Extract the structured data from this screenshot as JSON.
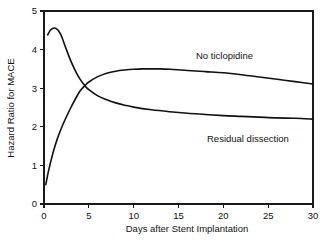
{
  "chart_data": {
    "type": "line",
    "title": "",
    "xlabel": "Days after Stent Implantation",
    "ylabel": "Hazard Ratio for MACE",
    "xlim": [
      0,
      30
    ],
    "ylim": [
      0,
      5
    ],
    "xticks": [
      0,
      5,
      10,
      15,
      20,
      25,
      30
    ],
    "xtick_labels": [
      "0",
      "5",
      "10",
      "15",
      "20",
      "25",
      "30"
    ],
    "yticks": [
      0,
      1,
      2,
      3,
      4,
      5
    ],
    "ytick_labels": [
      "0",
      "1",
      "2",
      "3",
      "4",
      "5"
    ],
    "grid": false,
    "legend_position": "inline-annotations",
    "frame": "box",
    "series": [
      {
        "name": "No ticlopidine",
        "color": "#111111",
        "label_position": {
          "x": 16.6,
          "y": 4.05
        },
        "x": [
          0.2,
          0.5,
          1.0,
          1.5,
          2.0,
          2.5,
          3.0,
          3.5,
          4.0,
          4.5,
          5.0,
          6.0,
          7.0,
          8.0,
          9.0,
          10.0,
          11.0,
          12.0,
          13.0,
          14.0,
          16.0,
          18.0,
          20.0,
          22.0,
          24.0,
          26.0,
          28.0,
          30.0
        ],
        "y": [
          0.5,
          0.85,
          1.32,
          1.7,
          2.0,
          2.26,
          2.5,
          2.72,
          2.92,
          3.05,
          3.16,
          3.3,
          3.39,
          3.44,
          3.47,
          3.49,
          3.5,
          3.5,
          3.5,
          3.49,
          3.46,
          3.43,
          3.4,
          3.35,
          3.29,
          3.23,
          3.17,
          3.11
        ]
      },
      {
        "name": "Residual dissection",
        "color": "#111111",
        "label_position": {
          "x": 18.0,
          "y": 2.55
        },
        "x": [
          0.4,
          0.7,
          1.0,
          1.2,
          1.5,
          1.8,
          2.0,
          2.5,
          3.0,
          3.5,
          4.0,
          4.5,
          5.0,
          6.0,
          7.0,
          8.0,
          9.0,
          10.0,
          12.0,
          14.0,
          16.0,
          18.0,
          20.0,
          22.0,
          24.0,
          26.0,
          28.0,
          30.0
        ],
        "y": [
          4.38,
          4.5,
          4.55,
          4.56,
          4.52,
          4.42,
          4.32,
          4.0,
          3.7,
          3.45,
          3.24,
          3.08,
          2.96,
          2.8,
          2.7,
          2.62,
          2.56,
          2.51,
          2.44,
          2.39,
          2.35,
          2.32,
          2.29,
          2.27,
          2.25,
          2.23,
          2.22,
          2.2
        ]
      }
    ],
    "annotations": [
      {
        "text": "No ticlopidine",
        "x": 16.6,
        "y": 4.05
      },
      {
        "text": "Residual dissection",
        "x": 18.0,
        "y": 2.55
      }
    ]
  },
  "labels": {
    "y_axis_title": "Hazard Ratio for MACE",
    "x_axis_title": "Days after Stent Implantation",
    "series_no_ticlopidine": "No ticlopidine",
    "series_residual_dissection": "Residual dissection"
  },
  "colors": {
    "curve": "#111111",
    "axis": "#1a1a1a",
    "background": "#ffffff"
  }
}
